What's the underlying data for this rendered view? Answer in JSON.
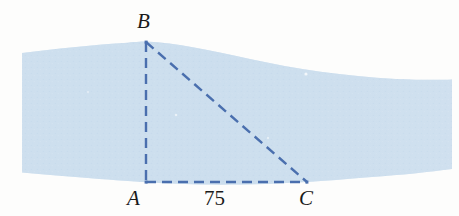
{
  "figure": {
    "name": "river-crossing-triangle",
    "background_color": "#fdfdfc"
  },
  "river": {
    "name": "river-band",
    "fill_color": "#cddfee",
    "speckle_color": "#bed5e9",
    "description": "horizontal shaded band representing a river",
    "top_edge_points": "22,52 70,48 120,44 146,42 200,46 260,60 330,74 400,80 450,80",
    "bottom_edge_points": "22,172 70,176 120,180 146,182 220,184 280,185 307,182 380,176 450,170"
  },
  "triangle": {
    "name": "survey-triangle",
    "line_color": "#4a6fae",
    "line_width": 2.4,
    "dash_pattern": "10 6",
    "vertices": {
      "B": {
        "x": 146,
        "y": 42
      },
      "A": {
        "x": 146,
        "y": 182
      },
      "C": {
        "x": 307,
        "y": 182
      }
    },
    "sides": [
      {
        "name": "side-AB",
        "from": "A",
        "to": "B",
        "style": "dashed"
      },
      {
        "name": "side-AC",
        "from": "A",
        "to": "C",
        "style": "dashed"
      },
      {
        "name": "side-BC",
        "from": "B",
        "to": "C",
        "style": "dashed"
      }
    ]
  },
  "labels": {
    "vertex_b": "B",
    "vertex_a": "A",
    "vertex_c": "C",
    "side_ac_length": "75"
  }
}
